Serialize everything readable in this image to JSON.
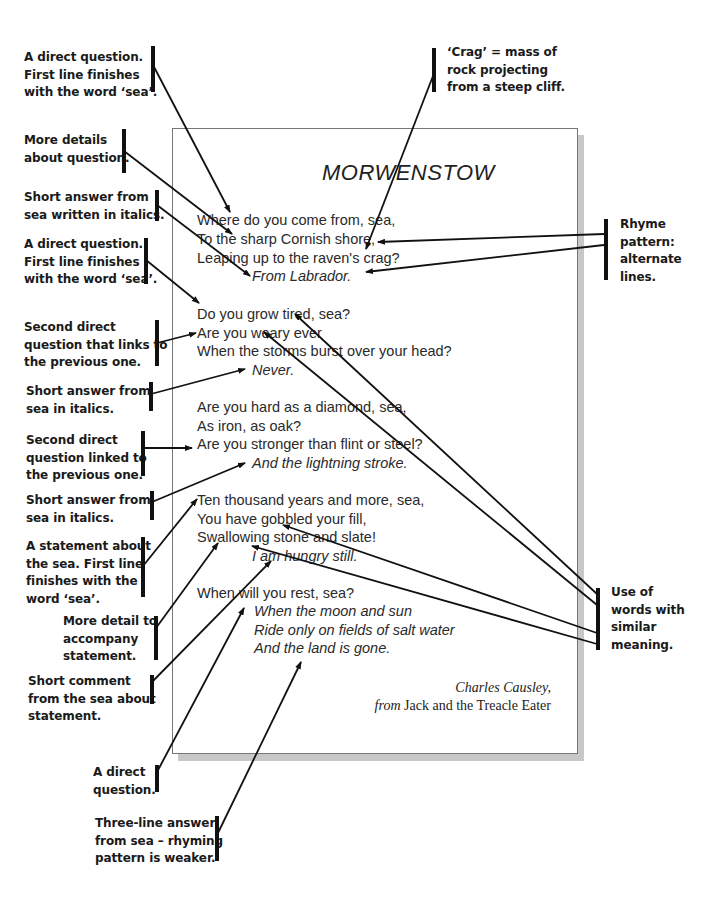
{
  "poem": {
    "title": "MORWENSTOW",
    "stanzas": [
      {
        "lines": [
          "Where do you come from, sea,",
          "To the sharp Cornish shore,",
          "Leaping up to the raven's crag?"
        ],
        "answer": [
          "From Labrador."
        ]
      },
      {
        "lines": [
          "Do you grow tired, sea?",
          "Are you weary ever",
          "When the storms burst over your head?"
        ],
        "answer": [
          "Never."
        ]
      },
      {
        "lines": [
          "Are you hard as a diamond, sea,",
          "As iron, as oak?",
          "Are you stronger than flint or steel?"
        ],
        "answer": [
          "And the lightning stroke."
        ]
      },
      {
        "lines": [
          "Ten thousand years and more, sea,",
          "You have gobbled your fill,",
          "Swallowing stone and slate!"
        ],
        "answer": [
          "I am hungry still."
        ]
      },
      {
        "lines": [
          "When will you rest, sea?"
        ],
        "answer": [
          "When the moon and sun",
          "Ride only on fields of salt water",
          "And the land is gone."
        ]
      }
    ],
    "author": "Charles Causley,",
    "source_prefix": "from",
    "source_title": "Jack and the Treacle Eater"
  },
  "annotations": {
    "left": [
      {
        "lines": [
          "A direct question.",
          "First line finishes",
          "with the word ‘sea’."
        ]
      },
      {
        "lines": [
          "More details",
          "about question."
        ]
      },
      {
        "lines": [
          "Short answer from",
          "sea written in italics."
        ]
      },
      {
        "lines": [
          "A direct question.",
          "First line finishes",
          "with the word ‘sea’."
        ]
      },
      {
        "lines": [
          "Second direct",
          "question that links to",
          "the previous one."
        ]
      },
      {
        "lines": [
          "Short answer from",
          "sea in italics."
        ]
      },
      {
        "lines": [
          "Second direct",
          "question linked to",
          "the previous one."
        ]
      },
      {
        "lines": [
          "Short answer from",
          "sea in italics."
        ]
      },
      {
        "lines": [
          "A statement about",
          "the sea. First line",
          "finishes with the",
          "word ‘sea’."
        ]
      },
      {
        "lines": [
          "More detail to",
          "accompany",
          "statement."
        ]
      },
      {
        "lines": [
          "Short comment",
          "from the sea about",
          "statement."
        ]
      },
      {
        "lines": [
          "A direct",
          "question."
        ]
      },
      {
        "lines": [
          "Three-line answer",
          "from sea – rhyming",
          "pattern is weaker."
        ]
      }
    ],
    "right": [
      {
        "lines": [
          "‘Crag’ = mass of",
          "rock projecting",
          "from a steep cliff."
        ]
      },
      {
        "lines": [
          "Rhyme",
          "pattern:",
          "alternate",
          "lines."
        ]
      },
      {
        "lines": [
          "Use of",
          "words with",
          "similar",
          "meaning."
        ]
      }
    ]
  },
  "colors": {
    "ink": "#111111",
    "page_border": "#777777",
    "shadow": "#c8c8c8"
  }
}
